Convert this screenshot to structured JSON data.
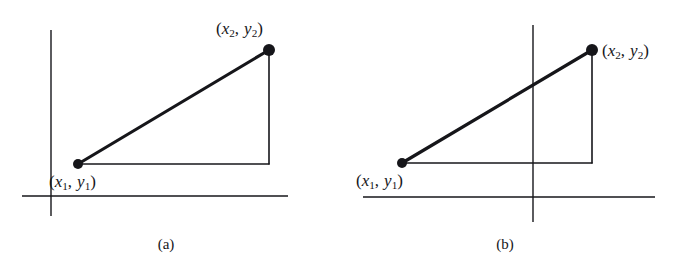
{
  "figure": {
    "background_color": "#ffffff",
    "ink_color": "#16161a",
    "width": 690,
    "height": 273,
    "panels": [
      {
        "id": "a",
        "caption": "(a)",
        "axes": {
          "y_axis": {
            "x": 51,
            "y_top": 30,
            "y_bottom": 216
          },
          "x_axis": {
            "y": 196,
            "x_left": 22,
            "x_right": 288
          }
        },
        "points": [
          {
            "name": "point-1",
            "label_parts": {
              "open": "(",
              "x_var": "x",
              "x_sub": "1",
              "comma": ",",
              "y_var": "y",
              "y_sub": "2_unused",
              "close": ")"
            },
            "label_text": "(x1, y1)",
            "cx": 78,
            "cy": 164,
            "radius": 5
          },
          {
            "name": "point-2",
            "label_text": "(x2, y2)",
            "cx": 269,
            "cy": 50,
            "radius": 6
          }
        ],
        "segment": {
          "x1": 78,
          "y1": 164,
          "x2": 269,
          "y2": 50
        },
        "leg_horizontal": {
          "x1": 78,
          "y1": 164,
          "x2": 269,
          "y2": 164
        },
        "leg_vertical": {
          "x1": 269,
          "y1": 164,
          "x2": 269,
          "y2": 50
        }
      },
      {
        "id": "b",
        "caption": "(b)",
        "axes": {
          "y_axis": {
            "x": 188,
            "y_top": 25,
            "y_bottom": 222
          },
          "x_axis": {
            "y": 197,
            "x_left": 18,
            "x_right": 310
          }
        },
        "points": [
          {
            "name": "point-1",
            "label_text": "(x1, y1)",
            "cx": 57,
            "cy": 163,
            "radius": 5
          },
          {
            "name": "point-2",
            "label_text": "(x2, y2)",
            "cx": 247,
            "cy": 50,
            "radius": 6
          }
        ],
        "segment": {
          "x1": 57,
          "y1": 163,
          "x2": 247,
          "y2": 50
        },
        "leg_horizontal": {
          "x1": 57,
          "y1": 163,
          "x2": 247,
          "y2": 163
        },
        "leg_vertical": {
          "x1": 247,
          "y1": 163,
          "x2": 247,
          "y2": 50
        }
      }
    ],
    "labels": {
      "open_paren": "(",
      "close_paren": ")",
      "comma": ",",
      "x_var": "x",
      "y_var": "y",
      "sub_1": "1",
      "sub_2": "2",
      "caption_a": "(a)",
      "caption_b": "(b)"
    }
  }
}
